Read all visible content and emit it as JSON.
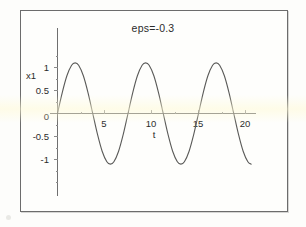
{
  "figure": {
    "title": "eps=-0.3",
    "background_color": "#fdfdfb",
    "frame_color": "#6c6c6c",
    "curve_color": "#5a5a58",
    "axis_color": "#6f6f6f"
  },
  "chart_data": {
    "type": "line",
    "title": "eps=-0.3",
    "xlabel": "t",
    "ylabel": "x1",
    "xlim": [
      -0.6,
      21.5
    ],
    "ylim": [
      -1.35,
      1.35
    ],
    "grid": false,
    "legend": null,
    "x_ticks": [
      5,
      10,
      15,
      20
    ],
    "x_tick_labels": [
      "5",
      "10",
      "15",
      "20"
    ],
    "y_ticks": [
      -1,
      -0.5,
      0,
      0.5,
      1
    ],
    "y_tick_labels": [
      "-1",
      "-0.5",
      "0",
      "0.5",
      "1"
    ],
    "origin_label": "0",
    "amplitude": 1.1,
    "period": 7.5,
    "series": [
      {
        "name": "x1(t)",
        "x": [
          0,
          0.5,
          1,
          1.5,
          1.875,
          2.25,
          2.75,
          3.25,
          3.75,
          4.25,
          4.75,
          5.25,
          5.625,
          6,
          6.5,
          7,
          7.5,
          8,
          8.5,
          9,
          9.375,
          9.75,
          10.25,
          10.75,
          11.25,
          11.75,
          12.25,
          12.75,
          13.125,
          13.5,
          14,
          14.5,
          15,
          15.5,
          16,
          16.5,
          16.875,
          17.25,
          17.75,
          18.25,
          18.75,
          19.25,
          19.75,
          20.25,
          20.6
        ],
        "y": [
          0,
          0.45,
          0.82,
          1.05,
          1.1,
          1.05,
          0.82,
          0.45,
          0,
          -0.45,
          -0.82,
          -1.05,
          -1.1,
          -1.05,
          -0.82,
          -0.45,
          0,
          0.45,
          0.82,
          1.05,
          1.1,
          1.05,
          0.82,
          0.45,
          0,
          -0.45,
          -0.82,
          -1.05,
          -1.1,
          -1.05,
          -0.82,
          -0.45,
          0,
          0.45,
          0.82,
          1.05,
          1.1,
          1.05,
          0.82,
          0.45,
          0,
          -0.45,
          -0.82,
          -1.05,
          -1.1
        ]
      }
    ]
  }
}
